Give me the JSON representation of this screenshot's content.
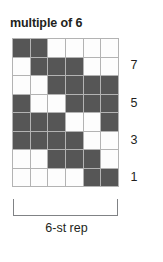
{
  "chart_data": {
    "type": "heatmap",
    "title": "multiple of 6",
    "xlabel": "6-st rep",
    "ylabel": "",
    "columns": 6,
    "rows": 8,
    "legend": {
      "dark": "knit / filled stitch",
      "light": "purl / empty stitch"
    },
    "colors": {
      "dark": "#565656",
      "light": "#fdfdfd",
      "grid_line": "#b3b3b3",
      "bracket": "#808285",
      "text": "#231f20"
    },
    "row_labels": [
      "7",
      "5",
      "3",
      "1"
    ],
    "row_label_rows": [
      7,
      5,
      3,
      1
    ],
    "cells": [
      [
        1,
        1,
        0,
        0,
        0,
        0
      ],
      [
        0,
        1,
        1,
        1,
        0,
        0
      ],
      [
        0,
        0,
        1,
        1,
        1,
        1
      ],
      [
        1,
        0,
        0,
        1,
        1,
        1
      ],
      [
        1,
        1,
        1,
        0,
        0,
        1
      ],
      [
        1,
        1,
        1,
        1,
        0,
        0
      ],
      [
        0,
        0,
        1,
        1,
        1,
        0
      ],
      [
        0,
        0,
        0,
        0,
        1,
        1
      ]
    ],
    "row_numbers_top_to_bottom": [
      8,
      7,
      6,
      5,
      4,
      3,
      2,
      1
    ]
  },
  "chart": {
    "title": "multiple of 6",
    "caption": "6-st rep"
  }
}
